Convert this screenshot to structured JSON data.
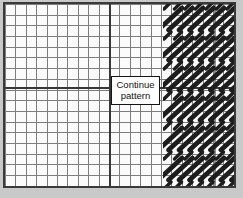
{
  "label_box": {
    "line1": "Continue",
    "line2": "pattern"
  },
  "colors": {
    "page_bg": "#c9c9c9",
    "chart_bg": "#fbfbfb",
    "grid_line": "#7d7d7d",
    "grid_bold": "#383838",
    "border": "#3a3a3a",
    "box_border": "#141414",
    "stitch": "#1d1d1d"
  },
  "stitch_pattern": {
    "type": "diagonal-slash-stitch-rows",
    "bands": 6,
    "band_spacing": 30,
    "first_band_bottom_y": 26,
    "columns": 8,
    "column_pitch": 10.5,
    "x_start": -5,
    "slash_dx": 24,
    "slash_dy": 22,
    "slash_width": 4.8,
    "fragment_rows": 7,
    "fragment_row_spacing": 30,
    "fragment_first_y": 1,
    "fragment_cols": 7,
    "fragment_x_start": 1,
    "fragment_pitch": 10.5,
    "fragment_len": 7,
    "fragment_width": 3.4
  }
}
